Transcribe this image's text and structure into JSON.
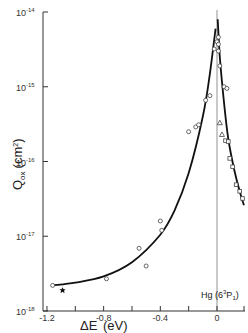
{
  "chart_data": {
    "type": "scatter",
    "title": "",
    "xlabel": "ΔE",
    "xlabel_unit": "(eV)",
    "ylabel": "Q",
    "ylabel_sub": "ox",
    "ylabel_unit": "(cm²)",
    "yscale": "log",
    "xlim": [
      -1.2,
      0.1
    ],
    "ylim": [
      1e-18,
      1e-14
    ],
    "x_ticks": [
      -1.2,
      -1.0,
      -0.8,
      -0.6,
      -0.4,
      -0.2,
      0.0
    ],
    "x_tick_labels": [
      "-1.2",
      "",
      "-0.8",
      "",
      "-0.4",
      "",
      "0"
    ],
    "y_ticks": [
      "10^-14",
      "10^-15",
      "10^-16",
      "10^-17",
      "10^-18"
    ],
    "y_tick_exponents": [
      "-14",
      "-15",
      "-16",
      "-17",
      "-18"
    ],
    "grid": false,
    "annotations": [
      {
        "text": "Hg (6 ³P₁)",
        "x": 0.0,
        "note": "vertical reference line at ΔE = 0"
      }
    ],
    "series": [
      {
        "name": "circles (left branch)",
        "marker": "circle",
        "points": [
          [
            -1.16,
            2.2e-18
          ],
          [
            -0.78,
            2.7e-18
          ],
          [
            -0.55,
            6.9e-18
          ],
          [
            -0.5,
            4e-18
          ],
          [
            -0.4,
            1.6e-17
          ],
          [
            -0.39,
            1.2e-17
          ],
          [
            -0.2,
            2.5e-16
          ],
          [
            -0.15,
            2.9e-16
          ],
          [
            -0.13,
            3.1e-16
          ],
          [
            -0.08,
            6.6e-16
          ],
          [
            -0.05,
            7.6e-16
          ],
          [
            -0.02,
            3.2e-15
          ],
          [
            0.0,
            4e-15
          ]
        ]
      },
      {
        "name": "star",
        "marker": "star",
        "points": [
          [
            -1.09,
            1.9e-18
          ]
        ]
      },
      {
        "name": "circles (right branch)",
        "marker": "circle",
        "points": [
          [
            0.01,
            4.6e-15
          ],
          [
            0.01,
            3.7e-15
          ],
          [
            0.01,
            3e-15
          ],
          [
            0.02,
            1.9e-15
          ],
          [
            0.05,
            1e-15
          ],
          [
            0.07,
            9.5e-16
          ]
        ]
      },
      {
        "name": "triangles",
        "marker": "triangle",
        "points": [
          [
            0.02,
            3.3e-16
          ],
          [
            0.035,
            2.3e-16
          ]
        ]
      },
      {
        "name": "squares",
        "marker": "square",
        "points": [
          [
            0.06,
            1.9e-16
          ],
          [
            0.08,
            1.85e-16
          ],
          [
            0.09,
            1.1e-16
          ],
          [
            0.11,
            8.5e-17
          ],
          [
            0.135,
            4.9e-17
          ],
          [
            0.16,
            4e-17
          ],
          [
            0.18,
            3.2e-17
          ]
        ]
      }
    ],
    "fit_curves": [
      {
        "name": "left fit",
        "x": [
          -1.16,
          -1.0,
          -0.8,
          -0.6,
          -0.4,
          -0.3,
          -0.2,
          -0.1,
          -0.05,
          -0.01
        ],
        "y": [
          2.2e-18,
          2.4e-18,
          2.9e-18,
          4.5e-18,
          1.05e-17,
          2.2e-17,
          7e-17,
          4e-16,
          1.5e-15,
          6e-15
        ]
      },
      {
        "name": "right fit",
        "x": [
          0.005,
          0.02,
          0.05,
          0.08,
          0.12,
          0.16,
          0.19
        ],
        "y": [
          8e-15,
          2.5e-15,
          6e-16,
          2e-16,
          8e-17,
          4e-17,
          2.6e-17
        ]
      }
    ]
  },
  "labels": {
    "y_axis_Q": "Q",
    "y_axis_sub": "ox",
    "y_axis_unit": "(cm",
    "y_axis_unit_sup": "2",
    "y_axis_unit_close": ")",
    "x_axis_title": "ΔE",
    "x_axis_unit": "(eV)",
    "annotation_hg": "Hg (6",
    "annotation_sup": "3",
    "annotation_p": "P",
    "annotation_sub": "1",
    "annotation_close": ")",
    "y_tick_base": "10"
  }
}
